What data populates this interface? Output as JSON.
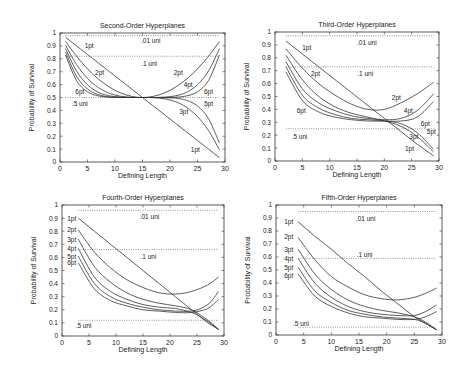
{
  "figure": {
    "x_label": "Defining Length",
    "y_label": "Probability of Survival"
  },
  "chart_data": [
    {
      "type": "line",
      "title": "Second-Order Hyperplanes",
      "xlabel": "Defining Length",
      "ylabel": "Probability of Survival",
      "xlim": [
        0,
        30
      ],
      "ylim": [
        0,
        1
      ],
      "xticks": [
        0,
        5,
        10,
        15,
        20,
        25,
        30
      ],
      "yticks": [
        0,
        0.1,
        0.2,
        0.3,
        0.4,
        0.5,
        0.6,
        0.7,
        0.8,
        0.9,
        1
      ],
      "grid": false,
      "x": [
        1,
        3,
        5,
        7,
        9,
        11,
        13,
        15,
        17,
        19,
        21,
        23,
        25,
        27,
        29
      ],
      "series": [
        {
          "name": "1pt",
          "values": [
            0.967,
            0.9,
            0.833,
            0.767,
            0.7,
            0.633,
            0.567,
            0.5,
            0.433,
            0.367,
            0.3,
            0.233,
            0.167,
            0.1,
            0.033
          ]
        },
        {
          "name": "2pt",
          "values": [
            0.935,
            0.82,
            0.722,
            0.642,
            0.58,
            0.536,
            0.509,
            0.5,
            0.509,
            0.536,
            0.58,
            0.642,
            0.722,
            0.82,
            0.935
          ]
        },
        {
          "name": "3pt",
          "values": [
            0.906,
            0.756,
            0.648,
            0.576,
            0.532,
            0.51,
            0.501,
            0.5,
            0.499,
            0.49,
            0.468,
            0.424,
            0.352,
            0.244,
            0.094
          ]
        },
        {
          "name": "4pt",
          "values": [
            0.879,
            0.705,
            0.599,
            0.54,
            0.513,
            0.503,
            0.5,
            0.5,
            0.5,
            0.503,
            0.513,
            0.54,
            0.599,
            0.705,
            0.879
          ]
        },
        {
          "name": "5pt",
          "values": [
            0.854,
            0.664,
            0.566,
            0.522,
            0.505,
            0.501,
            0.5,
            0.5,
            0.5,
            0.499,
            0.495,
            0.478,
            0.434,
            0.336,
            0.146
          ]
        },
        {
          "name": "6pt",
          "values": [
            0.83,
            0.631,
            0.544,
            0.512,
            0.502,
            0.5,
            0.5,
            0.5,
            0.5,
            0.5,
            0.502,
            0.512,
            0.544,
            0.631,
            0.83
          ]
        }
      ],
      "reference_lines": [
        {
          "name": ".01 uni",
          "y": 0.98,
          "x_range": [
            1,
            29
          ]
        },
        {
          "name": ".1 uni",
          "y": 0.82,
          "x_range": [
            1,
            29
          ]
        },
        {
          "name": ".5 uni",
          "y": 0.5,
          "x_range": [
            1,
            29
          ]
        }
      ],
      "annotations": [
        {
          "text": "1pt",
          "x": 5.3,
          "y": 0.9
        },
        {
          "text": "2pt",
          "x": 7.2,
          "y": 0.69
        },
        {
          "text": "6pt",
          "x": 3.6,
          "y": 0.55
        },
        {
          "text": ".5 uni",
          "x": 3.6,
          "y": 0.45
        },
        {
          "text": ".01 uni",
          "x": 16.5,
          "y": 0.94
        },
        {
          "text": ".1 uni",
          "x": 16.2,
          "y": 0.76
        },
        {
          "text": "2pt",
          "x": 21.5,
          "y": 0.69
        },
        {
          "text": "4pt",
          "x": 23.3,
          "y": 0.6
        },
        {
          "text": "6pt",
          "x": 27.0,
          "y": 0.55
        },
        {
          "text": "5pt",
          "x": 27.0,
          "y": 0.45
        },
        {
          "text": "3pt",
          "x": 22.5,
          "y": 0.39
        },
        {
          "text": "1pt",
          "x": 24.6,
          "y": 0.1
        }
      ]
    },
    {
      "type": "line",
      "title": "Third-Order Hyperplanes",
      "xlabel": "Defining Length",
      "ylabel": "Probability of Survival",
      "xlim": [
        0,
        30
      ],
      "ylim": [
        0,
        1
      ],
      "xticks": [
        0,
        5,
        10,
        15,
        20,
        25,
        30
      ],
      "yticks": [
        0,
        0.1,
        0.2,
        0.3,
        0.4,
        0.5,
        0.6,
        0.7,
        0.8,
        0.9,
        1
      ],
      "grid": false,
      "x": [
        2,
        5,
        8,
        11,
        14,
        17,
        20,
        23,
        26,
        29
      ],
      "series": [
        {
          "name": "1pt",
          "values": [
            0.93,
            0.83,
            0.73,
            0.63,
            0.53,
            0.43,
            0.33,
            0.23,
            0.13,
            0.04
          ]
        },
        {
          "name": "2pt",
          "values": [
            0.87,
            0.72,
            0.6,
            0.51,
            0.44,
            0.4,
            0.4,
            0.45,
            0.52,
            0.61
          ]
        },
        {
          "name": "3pt",
          "values": [
            0.82,
            0.63,
            0.5,
            0.42,
            0.37,
            0.34,
            0.31,
            0.27,
            0.19,
            0.07
          ]
        },
        {
          "name": "4pt",
          "values": [
            0.77,
            0.56,
            0.45,
            0.39,
            0.35,
            0.33,
            0.32,
            0.33,
            0.39,
            0.52
          ]
        },
        {
          "name": "5pt",
          "values": [
            0.73,
            0.51,
            0.41,
            0.36,
            0.33,
            0.32,
            0.31,
            0.29,
            0.22,
            0.09
          ]
        },
        {
          "name": "6pt",
          "values": [
            0.69,
            0.47,
            0.38,
            0.34,
            0.32,
            0.31,
            0.31,
            0.31,
            0.34,
            0.46
          ]
        }
      ],
      "reference_lines": [
        {
          "name": ".01 uni",
          "y": 0.97,
          "x_range": [
            2,
            29
          ]
        },
        {
          "name": ".1 uni",
          "y": 0.73,
          "x_range": [
            2,
            29
          ]
        },
        {
          "name": ".5 uni",
          "y": 0.25,
          "x_range": [
            2,
            29
          ]
        }
      ],
      "annotations": [
        {
          "text": "1pt",
          "x": 5.8,
          "y": 0.88
        },
        {
          "text": "2pt",
          "x": 7.4,
          "y": 0.68
        },
        {
          "text": "6pt",
          "x": 4.8,
          "y": 0.39
        },
        {
          "text": ".5 uni",
          "x": 4.5,
          "y": 0.19
        },
        {
          "text": ".01 uni",
          "x": 16.8,
          "y": 0.92
        },
        {
          "text": ".1 uni",
          "x": 16.5,
          "y": 0.68
        },
        {
          "text": "2pt",
          "x": 22.2,
          "y": 0.49
        },
        {
          "text": "4pt",
          "x": 24.4,
          "y": 0.39
        },
        {
          "text": "6pt",
          "x": 27.5,
          "y": 0.29
        },
        {
          "text": "5pt",
          "x": 28.6,
          "y": 0.23
        },
        {
          "text": "3pt",
          "x": 25.4,
          "y": 0.19
        },
        {
          "text": "1pt",
          "x": 24.6,
          "y": 0.1
        }
      ]
    },
    {
      "type": "line",
      "title": "Fourth-Order Hyperplanes",
      "xlabel": "Defining Length",
      "ylabel": "Probability of Survival",
      "xlim": [
        0,
        30
      ],
      "ylim": [
        0,
        1
      ],
      "xticks": [
        0,
        5,
        10,
        15,
        20,
        25,
        30
      ],
      "yticks": [
        0,
        0.1,
        0.2,
        0.3,
        0.4,
        0.5,
        0.6,
        0.7,
        0.8,
        0.9,
        1
      ],
      "grid": false,
      "x": [
        3,
        6,
        9,
        12,
        15,
        18,
        21,
        24,
        27,
        29
      ],
      "series": [
        {
          "name": "1pt",
          "values": [
            0.9,
            0.8,
            0.7,
            0.6,
            0.5,
            0.4,
            0.3,
            0.2,
            0.1,
            0.05
          ]
        },
        {
          "name": "2pt",
          "values": [
            0.81,
            0.64,
            0.52,
            0.43,
            0.37,
            0.33,
            0.32,
            0.34,
            0.39,
            0.45
          ]
        },
        {
          "name": "3pt",
          "values": [
            0.74,
            0.53,
            0.41,
            0.33,
            0.28,
            0.25,
            0.23,
            0.2,
            0.12,
            0.05
          ]
        },
        {
          "name": "4pt",
          "values": [
            0.67,
            0.45,
            0.34,
            0.28,
            0.24,
            0.22,
            0.21,
            0.19,
            0.24,
            0.34
          ]
        },
        {
          "name": "5pt",
          "values": [
            0.61,
            0.4,
            0.3,
            0.25,
            0.22,
            0.2,
            0.19,
            0.18,
            0.11,
            0.05
          ]
        },
        {
          "name": "6pt",
          "values": [
            0.56,
            0.36,
            0.27,
            0.23,
            0.2,
            0.19,
            0.18,
            0.18,
            0.21,
            0.28
          ]
        }
      ],
      "reference_lines": [
        {
          "name": ".01 uni",
          "y": 0.96,
          "x_range": [
            3,
            29
          ]
        },
        {
          "name": ".1 uni",
          "y": 0.66,
          "x_range": [
            3,
            29
          ]
        },
        {
          "name": ".5 uni",
          "y": 0.12,
          "x_range": [
            3,
            29
          ]
        }
      ],
      "annotations": [
        {
          "text": "1pt",
          "x": 1.8,
          "y": 0.9
        },
        {
          "text": "2pt",
          "x": 1.8,
          "y": 0.81
        },
        {
          "text": "3pt",
          "x": 1.8,
          "y": 0.74
        },
        {
          "text": "4pt",
          "x": 1.8,
          "y": 0.67
        },
        {
          "text": "5pt",
          "x": 1.8,
          "y": 0.61
        },
        {
          "text": "6pt",
          "x": 1.8,
          "y": 0.56
        },
        {
          "text": ".01 uni",
          "x": 16.2,
          "y": 0.91
        },
        {
          "text": ".1 uni",
          "x": 16.0,
          "y": 0.61
        },
        {
          "text": ".5 uni",
          "x": 4.0,
          "y": 0.08
        }
      ]
    },
    {
      "type": "line",
      "title": "Fifth-Order Hyperplanes",
      "xlabel": "Defining Length",
      "ylabel": "Probability of Survival",
      "xlim": [
        0,
        30
      ],
      "ylim": [
        0,
        1
      ],
      "xticks": [
        0,
        5,
        10,
        15,
        20,
        25,
        30
      ],
      "yticks": [
        0,
        0.1,
        0.2,
        0.3,
        0.4,
        0.5,
        0.6,
        0.7,
        0.8,
        0.9,
        1
      ],
      "grid": false,
      "x": [
        4,
        7,
        10,
        13,
        16,
        19,
        22,
        25,
        27,
        29
      ],
      "series": [
        {
          "name": "1pt",
          "values": [
            0.87,
            0.76,
            0.66,
            0.55,
            0.45,
            0.34,
            0.24,
            0.14,
            0.09,
            0.04
          ]
        },
        {
          "name": "2pt",
          "values": [
            0.75,
            0.58,
            0.45,
            0.37,
            0.31,
            0.28,
            0.27,
            0.29,
            0.32,
            0.36
          ]
        },
        {
          "name": "3pt",
          "values": [
            0.66,
            0.47,
            0.35,
            0.27,
            0.22,
            0.19,
            0.17,
            0.14,
            0.1,
            0.04
          ]
        },
        {
          "name": "4pt",
          "values": [
            0.59,
            0.4,
            0.29,
            0.22,
            0.18,
            0.16,
            0.15,
            0.15,
            0.18,
            0.23
          ]
        },
        {
          "name": "5pt",
          "values": [
            0.52,
            0.34,
            0.25,
            0.19,
            0.16,
            0.14,
            0.13,
            0.12,
            0.09,
            0.04
          ]
        },
        {
          "name": "6pt",
          "values": [
            0.47,
            0.3,
            0.22,
            0.17,
            0.14,
            0.13,
            0.12,
            0.12,
            0.14,
            0.18
          ]
        }
      ],
      "reference_lines": [
        {
          "name": ".01 uni",
          "y": 0.95,
          "x_range": [
            4,
            29
          ]
        },
        {
          "name": ".1 uni",
          "y": 0.59,
          "x_range": [
            4,
            29
          ]
        },
        {
          "name": ".5 uni",
          "y": 0.06,
          "x_range": [
            4,
            29
          ]
        }
      ],
      "annotations": [
        {
          "text": "1pt",
          "x": 2.3,
          "y": 0.87
        },
        {
          "text": "2pt",
          "x": 2.3,
          "y": 0.76
        },
        {
          "text": "3pt",
          "x": 2.3,
          "y": 0.66
        },
        {
          "text": "4pt",
          "x": 2.3,
          "y": 0.59
        },
        {
          "text": "5pt",
          "x": 2.3,
          "y": 0.52
        },
        {
          "text": "6pt",
          "x": 2.3,
          "y": 0.46
        },
        {
          "text": ".01 uni",
          "x": 16.2,
          "y": 0.9
        },
        {
          "text": ".1 uni",
          "x": 16.0,
          "y": 0.62
        },
        {
          "text": ".5 uni",
          "x": 4.5,
          "y": 0.09
        }
      ]
    }
  ]
}
